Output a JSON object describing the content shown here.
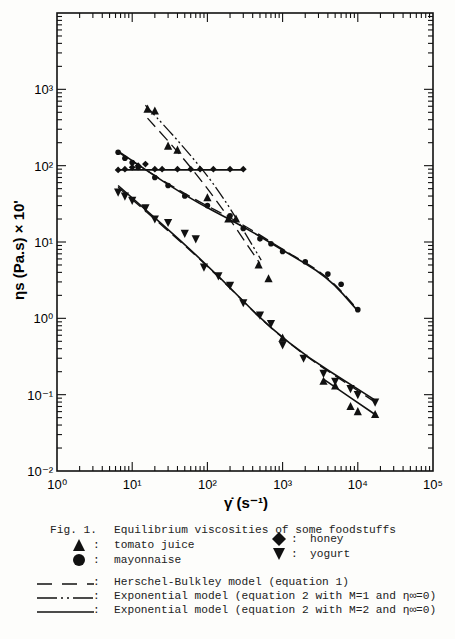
{
  "chart_data": {
    "type": "scatter",
    "title": "Equilibrium viscosities of some foodstuffs",
    "figure_label": "Fig. 1.",
    "xlabel": "γ̇ (s⁻¹)",
    "ylabel": "ηs (Pa.s) × 10'",
    "xscale": "log",
    "yscale": "log",
    "xlim": [
      1,
      100000
    ],
    "ylim": [
      0.01,
      10000
    ],
    "x_ticks": [
      "10⁰",
      "10¹",
      "10²",
      "10³",
      "10⁴",
      "10⁵"
    ],
    "y_ticks": [
      "10⁻²",
      "10⁻¹",
      "10⁰",
      "10¹",
      "10²",
      "10³"
    ],
    "grid": false,
    "series": [
      {
        "name": "tomato juice",
        "marker": "triangle-up",
        "points": [
          [
            16,
            550
          ],
          [
            20,
            520
          ],
          [
            30,
            180
          ],
          [
            40,
            160
          ],
          [
            100,
            38
          ],
          [
            190,
            20
          ],
          [
            240,
            20
          ],
          [
            480,
            5.0
          ],
          [
            650,
            3.3
          ],
          [
            1000,
            0.55
          ],
          [
            3500,
            0.15
          ],
          [
            5000,
            0.13
          ],
          [
            8000,
            0.07
          ],
          [
            10000,
            0.06
          ],
          [
            17000,
            0.055
          ]
        ]
      },
      {
        "name": "mayonnaise",
        "marker": "circle",
        "points": [
          [
            6.5,
            150
          ],
          [
            8,
            125
          ],
          [
            10,
            110
          ],
          [
            12,
            95
          ],
          [
            20,
            70
          ],
          [
            30,
            55
          ],
          [
            50,
            40
          ],
          [
            100,
            30
          ],
          [
            200,
            22
          ],
          [
            300,
            15
          ],
          [
            500,
            11
          ],
          [
            700,
            9.5
          ],
          [
            1000,
            7.5
          ],
          [
            2000,
            5.5
          ],
          [
            4000,
            3.8
          ],
          [
            6000,
            2.8
          ],
          [
            10000,
            1.3
          ]
        ]
      },
      {
        "name": "honey",
        "marker": "diamond",
        "points": [
          [
            6.5,
            88
          ],
          [
            8,
            90
          ],
          [
            10,
            95
          ],
          [
            12,
            100
          ],
          [
            15,
            105
          ],
          [
            20,
            90
          ],
          [
            25,
            90
          ],
          [
            40,
            90
          ],
          [
            60,
            90
          ],
          [
            80,
            90
          ],
          [
            120,
            90
          ],
          [
            200,
            90
          ],
          [
            300,
            90
          ]
        ]
      },
      {
        "name": "yogurt",
        "marker": "triangle-down",
        "points": [
          [
            6.5,
            45
          ],
          [
            8,
            40
          ],
          [
            10,
            35
          ],
          [
            15,
            28
          ],
          [
            20,
            20
          ],
          [
            30,
            18
          ],
          [
            50,
            13
          ],
          [
            70,
            11
          ],
          [
            90,
            4.7
          ],
          [
            140,
            3.6
          ],
          [
            200,
            2.7
          ],
          [
            300,
            1.6
          ],
          [
            500,
            1.1
          ],
          [
            700,
            0.85
          ],
          [
            1000,
            0.45
          ],
          [
            1900,
            0.3
          ],
          [
            3500,
            0.19
          ],
          [
            5000,
            0.15
          ],
          [
            8000,
            0.12
          ],
          [
            10000,
            0.1
          ],
          [
            17000,
            0.08
          ]
        ]
      }
    ],
    "model_curves": [
      {
        "name": "Herschel-Bulkley model (equation 1)",
        "style": "dashed",
        "curves": [
          [
            [
              16,
              420
            ],
            [
              50,
              120
            ],
            [
              150,
              30
            ],
            [
              500,
              5.2
            ]
          ],
          [
            [
              6.5,
              150
            ],
            [
              50,
              42
            ],
            [
              300,
              17
            ],
            [
              1000,
              8
            ],
            [
              4000,
              3.6
            ],
            [
              10000,
              1.3
            ]
          ],
          [
            [
              6.5,
              52
            ],
            [
              100,
              5
            ],
            [
              1000,
              0.5
            ],
            [
              17000,
              0.08
            ]
          ]
        ]
      },
      {
        "name": "Exponential model (equation 2 with M=1 and η∞=0)",
        "style": "dash-dot",
        "curves": [
          [
            [
              15,
              620
            ],
            [
              50,
              170
            ],
            [
              150,
              45
            ],
            [
              520,
              5.8
            ]
          ]
        ]
      },
      {
        "name": "Exponential model (equation 2 with M=2 and η∞=0)",
        "style": "solid",
        "curves": [
          [
            [
              6.5,
              155
            ],
            [
              50,
              40
            ],
            [
              300,
              16
            ],
            [
              1000,
              7.8
            ],
            [
              4000,
              3.5
            ],
            [
              10000,
              1.25
            ]
          ],
          [
            [
              6.5,
              88
            ],
            [
              300,
              88
            ]
          ],
          [
            [
              6.5,
              55
            ],
            [
              100,
              5.1
            ],
            [
              1000,
              0.5
            ],
            [
              17000,
              0.085
            ]
          ],
          [
            [
              3500,
              0.16
            ],
            [
              17000,
              0.055
            ]
          ]
        ]
      }
    ],
    "legend_position": "below"
  },
  "caption": {
    "figure_label": "Fig. 1.",
    "title": "Equilibrium viscosities of some foodstuffs",
    "markers": [
      {
        "symbol": "triangle-up",
        "label": "tomato juice"
      },
      {
        "symbol": "circle",
        "label": "mayonnaise"
      },
      {
        "symbol": "diamond",
        "label": "honey"
      },
      {
        "symbol": "triangle-down",
        "label": "yogurt"
      }
    ],
    "lines": [
      {
        "style": "dashed",
        "label": "Herschel-Bulkley model (equation 1)"
      },
      {
        "style": "dash-dot",
        "label": "Exponential model (equation 2 with M=1 and η∞=0)"
      },
      {
        "style": "solid",
        "label": "Exponential model (equation 2 with M=2 and η∞=0)"
      }
    ],
    "colon": ":"
  },
  "axes": {
    "x_label": "γ̇ (s⁻¹)",
    "y_label": "ηs (Pa.s) × 10'"
  },
  "colors": {
    "ink": "#111111",
    "paper": "#fdfdfb"
  }
}
